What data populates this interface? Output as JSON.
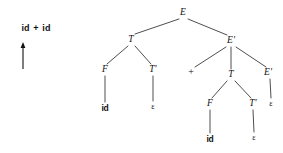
{
  "figure": {
    "type": "parse-tree",
    "width": 283,
    "height": 153,
    "background": "#ffffff",
    "ink_color": "#111111"
  },
  "sentence": {
    "label": "id + id",
    "tokens": [
      "id",
      "+",
      "id"
    ],
    "x": 36,
    "y": 28
  },
  "pointer": {
    "icon": "up-arrow-icon",
    "direction": "up",
    "x": 23,
    "y_tip": 42,
    "y_tail": 69
  },
  "tree": {
    "nodes": [
      {
        "id": "n0",
        "label": "E",
        "kind": "nonterminal",
        "x": 183,
        "y": 13
      },
      {
        "id": "n1",
        "label": "T",
        "kind": "nonterminal",
        "x": 131,
        "y": 40
      },
      {
        "id": "n2",
        "label": "E'",
        "kind": "nonterminal",
        "x": 231,
        "y": 41
      },
      {
        "id": "n3",
        "label": "F",
        "kind": "nonterminal",
        "x": 105,
        "y": 70
      },
      {
        "id": "n4",
        "label": "T'",
        "kind": "nonterminal",
        "x": 153,
        "y": 70
      },
      {
        "id": "n5",
        "label": "+",
        "kind": "terminal-plus",
        "x": 191,
        "y": 72
      },
      {
        "id": "n6",
        "label": "T",
        "kind": "nonterminal",
        "x": 231,
        "y": 75
      },
      {
        "id": "n7",
        "label": "E'",
        "kind": "nonterminal",
        "x": 268,
        "y": 73
      },
      {
        "id": "n8",
        "label": "id",
        "kind": "terminal-id",
        "x": 105,
        "y": 108
      },
      {
        "id": "n9",
        "label": "ε",
        "kind": "terminal-eps",
        "x": 153,
        "y": 107
      },
      {
        "id": "n10",
        "label": "F",
        "kind": "nonterminal",
        "x": 210,
        "y": 104
      },
      {
        "id": "n11",
        "label": "T'",
        "kind": "nonterminal",
        "x": 253,
        "y": 104
      },
      {
        "id": "n12",
        "label": "ε",
        "kind": "terminal-eps",
        "x": 271,
        "y": 104
      },
      {
        "id": "n13",
        "label": "id",
        "kind": "terminal-id",
        "x": 210,
        "y": 139
      },
      {
        "id": "n14",
        "label": "ε",
        "kind": "terminal-eps",
        "x": 254,
        "y": 138
      }
    ],
    "edges": [
      {
        "from": "n0",
        "to": "n1",
        "x1": 179,
        "y1": 19,
        "x2": 135,
        "y2": 34
      },
      {
        "from": "n0",
        "to": "n2",
        "x1": 188,
        "y1": 19,
        "x2": 227,
        "y2": 35
      },
      {
        "from": "n1",
        "to": "n3",
        "x1": 128,
        "y1": 46,
        "x2": 107,
        "y2": 64
      },
      {
        "from": "n1",
        "to": "n4",
        "x1": 135,
        "y1": 46,
        "x2": 151,
        "y2": 64
      },
      {
        "from": "n2",
        "to": "n5",
        "x1": 226,
        "y1": 47,
        "x2": 195,
        "y2": 67
      },
      {
        "from": "n2",
        "to": "n6",
        "x1": 231,
        "y1": 47,
        "x2": 231,
        "y2": 69
      },
      {
        "from": "n2",
        "to": "n7",
        "x1": 236,
        "y1": 47,
        "x2": 266,
        "y2": 67
      },
      {
        "from": "n3",
        "to": "n8",
        "x1": 105,
        "y1": 76,
        "x2": 105,
        "y2": 102
      },
      {
        "from": "n4",
        "to": "n9",
        "x1": 153,
        "y1": 76,
        "x2": 153,
        "y2": 101
      },
      {
        "from": "n6",
        "to": "n10",
        "x1": 227,
        "y1": 81,
        "x2": 212,
        "y2": 98
      },
      {
        "from": "n6",
        "to": "n11",
        "x1": 235,
        "y1": 81,
        "x2": 251,
        "y2": 98
      },
      {
        "from": "n7",
        "to": "n12",
        "x1": 270,
        "y1": 79,
        "x2": 271,
        "y2": 98
      },
      {
        "from": "n10",
        "to": "n13",
        "x1": 210,
        "y1": 110,
        "x2": 210,
        "y2": 133
      },
      {
        "from": "n11",
        "to": "n14",
        "x1": 253,
        "y1": 110,
        "x2": 254,
        "y2": 132
      }
    ]
  }
}
